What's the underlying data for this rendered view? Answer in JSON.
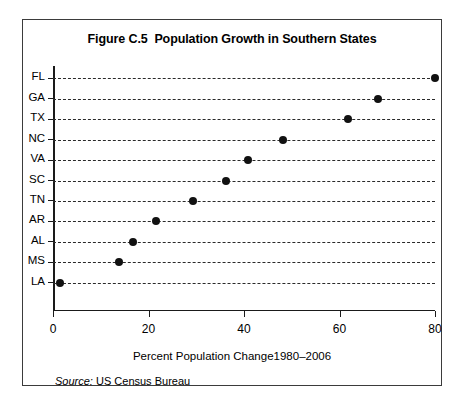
{
  "figure": {
    "title": "Figure C.5  Population Growth in Southern States",
    "source_label": "Source:",
    "source_text": "US Census Bureau"
  },
  "chart_data": {
    "type": "scatter",
    "orientation": "horizontal",
    "title": "Figure C.5  Population Growth in Southern States",
    "xlabel": "Percent Population Change1980–2006",
    "ylabel": "",
    "xlim": [
      0,
      80
    ],
    "ylim": null,
    "grid": "horizontal-dashed",
    "legend": null,
    "xticks": [
      0,
      20,
      40,
      60,
      80
    ],
    "xtick_labels": [
      "0",
      "20",
      "40",
      "60",
      "80"
    ],
    "categories": [
      "FL",
      "GA",
      "TX",
      "NC",
      "VA",
      "SC",
      "TN",
      "AR",
      "AL",
      "MS",
      "LA"
    ],
    "values": [
      80.0,
      68.0,
      61.8,
      48.2,
      40.8,
      36.2,
      29.3,
      21.6,
      16.8,
      13.8,
      1.5
    ],
    "points": [
      {
        "category": "FL",
        "value": 80.0
      },
      {
        "category": "GA",
        "value": 68.0
      },
      {
        "category": "TX",
        "value": 61.8
      },
      {
        "category": "NC",
        "value": 48.2
      },
      {
        "category": "VA",
        "value": 40.8
      },
      {
        "category": "SC",
        "value": 36.2
      },
      {
        "category": "TN",
        "value": 29.3
      },
      {
        "category": "AR",
        "value": 21.6
      },
      {
        "category": "AL",
        "value": 16.8
      },
      {
        "category": "MS",
        "value": 13.8
      },
      {
        "category": "LA",
        "value": 1.5
      }
    ],
    "marker_color": "#111111",
    "axis_color": "#1a1a1a",
    "grid_color": "#2a2a2a"
  }
}
